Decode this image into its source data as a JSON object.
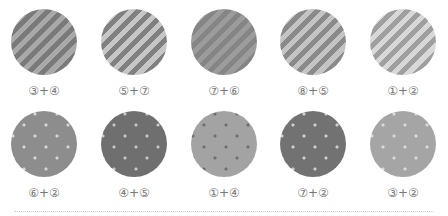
{
  "rows": [
    {
      "pattern": "stripes",
      "swatches": [
        {
          "label": "③+④",
          "color_a": "#7a7a7a",
          "color_b": "#a9a9a9"
        },
        {
          "label": "⑤+⑦",
          "color_a": "#808080",
          "color_b": "#c6c6c6"
        },
        {
          "label": "⑦+⑥",
          "color_a": "#858585",
          "color_b": "#9c9c9c"
        },
        {
          "label": "⑧+⑤",
          "color_a": "#8a8a8a",
          "color_b": "#c4c4c4"
        },
        {
          "label": "①+②",
          "color_a": "#9f9f9f",
          "color_b": "#d8d8d8"
        }
      ]
    },
    {
      "pattern": "dots",
      "swatches": [
        {
          "label": "⑥+②",
          "background": "#8d8d8d",
          "dot": "#d6d6d6"
        },
        {
          "label": "④+⑤",
          "background": "#6f6f6f",
          "dot": "#c8c8c8"
        },
        {
          "label": "①+④",
          "background": "#a3a3a3",
          "dot": "#6e6e6e"
        },
        {
          "label": "⑦+②",
          "background": "#727272",
          "dot": "#d0d0d0"
        },
        {
          "label": "③+②",
          "background": "#a5a5a5",
          "dot": "#dadada"
        }
      ]
    }
  ]
}
